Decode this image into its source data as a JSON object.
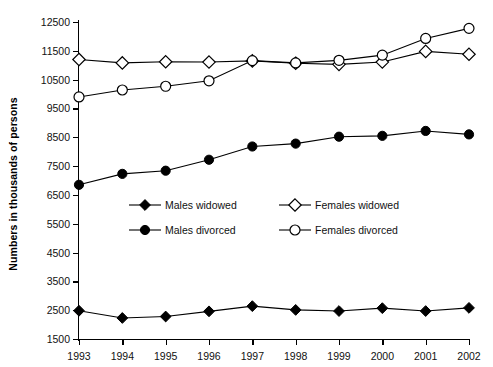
{
  "chart_data": {
    "type": "line",
    "title": "",
    "xlabel": "",
    "ylabel": "Numbers in thousands of persons",
    "categories": [
      "1993",
      "1994",
      "1995",
      "1996",
      "1997",
      "1998",
      "1999",
      "2000",
      "2001",
      "2002"
    ],
    "ylim": [
      1500,
      12500
    ],
    "ytick_step": 1000,
    "yticks": [
      "1500",
      "2500",
      "3500",
      "4500",
      "5500",
      "6500",
      "7500",
      "8500",
      "9500",
      "10500",
      "11500",
      "12500"
    ],
    "grid": false,
    "legend_position": "center-inside",
    "series": [
      {
        "name": "Males widowed",
        "marker": "filled-diamond",
        "values": [
          2480,
          2230,
          2280,
          2460,
          2640,
          2510,
          2470,
          2570,
          2470,
          2580
        ]
      },
      {
        "name": "Males divorced",
        "marker": "filled-circle",
        "values": [
          6850,
          7230,
          7340,
          7720,
          8180,
          8280,
          8520,
          8550,
          8720,
          8600
        ]
      },
      {
        "name": "Females widowed",
        "marker": "open-diamond",
        "values": [
          11200,
          11080,
          11120,
          11110,
          11150,
          11070,
          11030,
          11110,
          11480,
          11380
        ]
      },
      {
        "name": "Females divorced",
        "marker": "open-circle",
        "values": [
          9900,
          10140,
          10270,
          10460,
          11160,
          11080,
          11170,
          11350,
          11930,
          12280
        ]
      }
    ]
  }
}
